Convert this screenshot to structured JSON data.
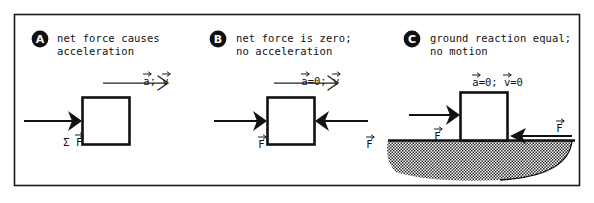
{
  "figure": {
    "type": "physics-free-body-diagram",
    "panel_count": 3,
    "frame_color": "#1a1a1a",
    "background": "#ffffff"
  },
  "panels": [
    {
      "marker": "A",
      "caption_line1": "net force causes",
      "caption_line2": "acceleration",
      "kinematics_label_parts": [
        "a",
        "; ",
        "v"
      ],
      "kinematics_label": "a; v",
      "kinematics_arrow": "right-arrow-motion",
      "forces": [
        {
          "name": "net-force-left",
          "label": "Σ F",
          "direction": "right"
        }
      ],
      "body": "block",
      "ground": false
    },
    {
      "marker": "B",
      "caption_line1": "net force is zero;",
      "caption_line2": "no acceleration",
      "kinematics_label_parts": [
        "a",
        "=0; ",
        "v"
      ],
      "kinematics_label": "a=0; v",
      "kinematics_arrow": "right-arrow-motion",
      "forces": [
        {
          "name": "force-left",
          "label": "F",
          "direction": "right"
        },
        {
          "name": "force-right",
          "label": "F",
          "direction": "left"
        }
      ],
      "body": "block",
      "ground": false
    },
    {
      "marker": "C",
      "caption_line1": "ground reaction equal;",
      "caption_line2": "no motion",
      "kinematics_label_parts": [
        "a",
        "=0; ",
        "v",
        "=0"
      ],
      "kinematics_label": "a=0; v=0",
      "kinematics_arrow": "none",
      "forces": [
        {
          "name": "applied-force-left",
          "label": "F",
          "direction": "right"
        },
        {
          "name": "ground-reaction-force-right",
          "label": "F",
          "direction": "left"
        }
      ],
      "body": "block",
      "ground": true
    }
  ],
  "symbols": {
    "sigma": "Σ",
    "vector_accent": "arrow-overbar",
    "acceleration": "a",
    "velocity": "v",
    "force": "F"
  }
}
